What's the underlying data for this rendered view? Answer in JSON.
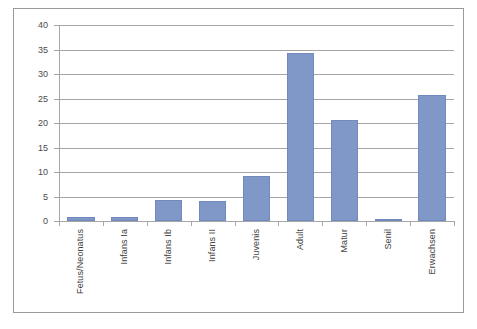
{
  "chart_data": {
    "type": "bar",
    "title": "",
    "xlabel": "",
    "ylabel": "",
    "ylim": [
      0,
      40
    ],
    "ytick_step": 5,
    "grid": true,
    "legend": "none",
    "bar_color": "#8098c8",
    "gridline_color": "#a6a6a6",
    "border_color": "#9a9a9a",
    "categories": [
      "Fetus/Neonatus",
      "Infans Ia",
      "Infans Ib",
      "Infans II",
      "Juvenis",
      "Adult",
      "Matur",
      "Senil",
      "Erwachsen"
    ],
    "values": [
      0.8,
      0.8,
      4.3,
      4.0,
      9.2,
      34.3,
      20.6,
      0.3,
      25.8
    ],
    "yticks": [
      0,
      5,
      10,
      15,
      20,
      25,
      30,
      35,
      40
    ],
    "ytick_labels": [
      "0",
      "5",
      "10",
      "15",
      "20",
      "25",
      "30",
      "35",
      "40"
    ]
  }
}
